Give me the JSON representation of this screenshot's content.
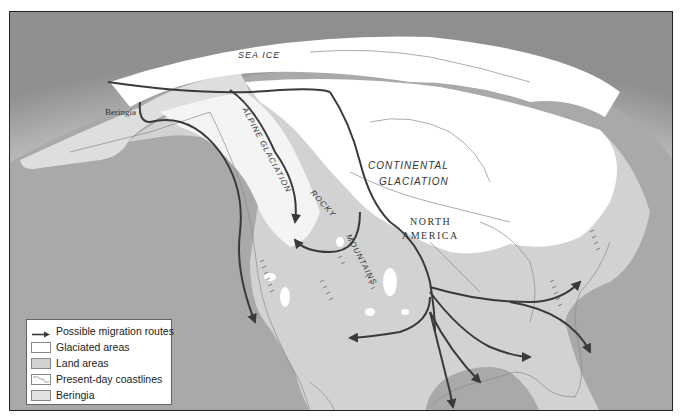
{
  "map": {
    "labels": {
      "sea_ice": "SEA   ICE",
      "beringia": "Beringia",
      "alpine_glaciation": "ALPINE GLACIATION",
      "continental_line1": "CONTINENTAL",
      "continental_line2": "GLACIATION",
      "north": "NORTH",
      "america": "AMERICA",
      "rocky": "ROCKY",
      "mountains": "MOUNTAINS"
    },
    "colors": {
      "ocean": "#a9a9a9",
      "land": "#d2d2d2",
      "beringia": "#dcdcdc",
      "glaciated": "#ffffff",
      "route": "#3a3a3a",
      "coastline": "#8a8a8a"
    }
  },
  "legend": {
    "items": [
      {
        "label": "Possible migration routes",
        "type": "arrow"
      },
      {
        "label": "Glaciated areas",
        "type": "swatch",
        "color": "#ffffff"
      },
      {
        "label": "Land areas",
        "type": "swatch",
        "color": "#d2d2d2"
      },
      {
        "label": "Present-day coastlines",
        "type": "coastline"
      },
      {
        "label": "Beringia",
        "type": "swatch",
        "color": "#e2e2e2"
      }
    ]
  }
}
